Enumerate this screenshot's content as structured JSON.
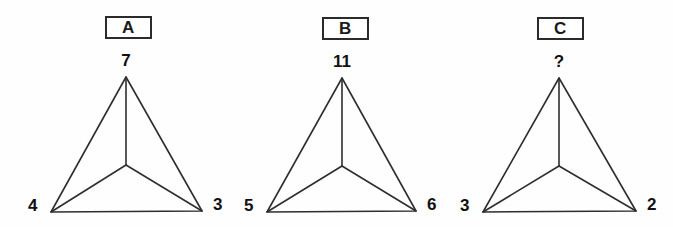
{
  "page": {
    "background_color": "#fefefe",
    "stroke_color": "#2e2e2e",
    "text_color": "#111111"
  },
  "figures": [
    {
      "box_label": "A",
      "apex_value": "7",
      "bottom_left_value": "4",
      "bottom_right_value": "3",
      "box": {
        "x": 105,
        "y": 16,
        "w": 47,
        "h": 23
      },
      "apex": {
        "x": 126,
        "y": 77
      },
      "bottom_left": {
        "x": 51,
        "y": 212
      },
      "bottom_right": {
        "x": 202,
        "y": 211
      },
      "center": {
        "x": 126,
        "y": 165
      }
    },
    {
      "box_label": "B",
      "apex_value": "11",
      "bottom_left_value": "5",
      "bottom_right_value": "6",
      "box": {
        "x": 322,
        "y": 17,
        "w": 47,
        "h": 23
      },
      "apex": {
        "x": 342,
        "y": 78
      },
      "bottom_left": {
        "x": 267,
        "y": 212
      },
      "bottom_right": {
        "x": 416,
        "y": 211
      },
      "center": {
        "x": 342,
        "y": 166
      }
    },
    {
      "box_label": "C",
      "apex_value": "?",
      "bottom_left_value": "3",
      "bottom_right_value": "2",
      "box": {
        "x": 537,
        "y": 17,
        "w": 47,
        "h": 23
      },
      "apex": {
        "x": 559,
        "y": 78
      },
      "bottom_left": {
        "x": 483,
        "y": 212
      },
      "bottom_right": {
        "x": 636,
        "y": 211
      },
      "center": {
        "x": 559,
        "y": 166
      }
    }
  ],
  "chart_data": {
    "type": "diagram",
    "items": [
      {
        "label": "A",
        "apex": 7,
        "left": 4,
        "right": 3
      },
      {
        "label": "B",
        "apex": 11,
        "left": 5,
        "right": 6
      },
      {
        "label": "C",
        "apex": "?",
        "left": 3,
        "right": 2
      }
    ]
  }
}
